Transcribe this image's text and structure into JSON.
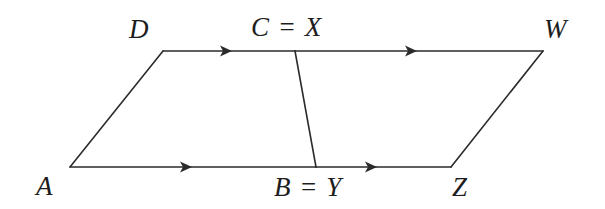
{
  "figure": {
    "kind": "geometry-diagram",
    "background_color": "#ffffff",
    "stroke_color": "#2b2b2b",
    "stroke_width": 1.6,
    "width": 605,
    "height": 209,
    "vertices": [
      {
        "id": "A",
        "label": "A",
        "x": 70,
        "y": 167
      },
      {
        "id": "D",
        "label": "D",
        "x": 163,
        "y": 51
      },
      {
        "id": "C",
        "label": "C = X",
        "x": 295,
        "y": 51
      },
      {
        "id": "B",
        "label": "B = Y",
        "x": 316,
        "y": 167
      },
      {
        "id": "W",
        "label": "W",
        "x": 543,
        "y": 51
      },
      {
        "id": "Z",
        "label": "Z",
        "x": 451,
        "y": 167
      }
    ],
    "segments": [
      {
        "id": "AD",
        "from": "A",
        "to": "D",
        "arrows": 0
      },
      {
        "id": "DC",
        "from": "D",
        "to": "C",
        "arrows": 1
      },
      {
        "id": "CW",
        "from": "C",
        "to": "W",
        "arrows": 1
      },
      {
        "id": "AB",
        "from": "A",
        "to": "B",
        "arrows": 1
      },
      {
        "id": "BZ",
        "from": "B",
        "to": "Z",
        "arrows": 1
      },
      {
        "id": "CB",
        "from": "C",
        "to": "B",
        "arrows": 0
      },
      {
        "id": "WZ",
        "from": "W",
        "to": "Z",
        "arrows": 0
      }
    ],
    "arrow_markers": [
      {
        "id": "arrow-DC",
        "on": "DC",
        "x": 228,
        "y": 51,
        "direction": "right"
      },
      {
        "id": "arrow-CW",
        "on": "CW",
        "x": 413,
        "y": 51,
        "direction": "right"
      },
      {
        "id": "arrow-AB",
        "on": "AB",
        "x": 188,
        "y": 167,
        "direction": "right"
      },
      {
        "id": "arrow-BZ",
        "on": "BZ",
        "x": 373,
        "y": 167,
        "direction": "right"
      }
    ],
    "labels": {
      "D": "D",
      "CX": "C = X",
      "W": "W",
      "A": "A",
      "BY": "B = Y",
      "Z": "Z"
    }
  }
}
